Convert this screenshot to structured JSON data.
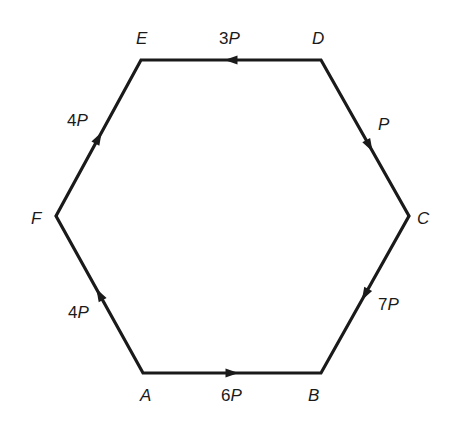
{
  "diagram": {
    "type": "force-hexagon",
    "stroke_color": "#1a1a1a",
    "background": "#ffffff",
    "vertices": [
      {
        "id": "A",
        "label": "A",
        "x": 143,
        "y": 373,
        "label_x": 140,
        "label_y": 387
      },
      {
        "id": "B",
        "label": "B",
        "x": 321,
        "y": 373,
        "label_x": 308,
        "label_y": 387
      },
      {
        "id": "C",
        "label": "C",
        "x": 409,
        "y": 216,
        "label_x": 417,
        "label_y": 210
      },
      {
        "id": "D",
        "label": "D",
        "x": 321,
        "y": 60,
        "label_x": 312,
        "label_y": 30
      },
      {
        "id": "E",
        "label": "E",
        "x": 141,
        "y": 60,
        "label_x": 136,
        "label_y": 30
      },
      {
        "id": "F",
        "label": "F",
        "x": 56,
        "y": 216,
        "label_x": 31,
        "label_y": 210
      }
    ],
    "forces": [
      {
        "edge": "AB",
        "from": "A",
        "to": "B",
        "coef": "6",
        "symbol": "P",
        "label_x": 221,
        "label_y": 387,
        "arrow_t": 0.5
      },
      {
        "edge": "DC",
        "from": "D",
        "to": "C",
        "coef": "",
        "symbol": "P",
        "label_x": 378,
        "label_y": 116,
        "arrow_t": 0.55
      },
      {
        "edge": "CB",
        "from": "C",
        "to": "B",
        "coef": "7",
        "symbol": "P",
        "label_x": 378,
        "label_y": 296,
        "arrow_t": 0.5
      },
      {
        "edge": "DE",
        "from": "D",
        "to": "E",
        "coef": "3",
        "symbol": "P",
        "label_x": 219,
        "label_y": 30,
        "arrow_t": 0.5
      },
      {
        "edge": "FE",
        "from": "F",
        "to": "E",
        "coef": "4",
        "symbol": "P",
        "label_x": 67,
        "label_y": 112,
        "arrow_t": 0.5
      },
      {
        "edge": "AF",
        "from": "A",
        "to": "F",
        "coef": "4",
        "symbol": "P",
        "label_x": 68,
        "label_y": 304,
        "arrow_t": 0.5
      }
    ]
  }
}
